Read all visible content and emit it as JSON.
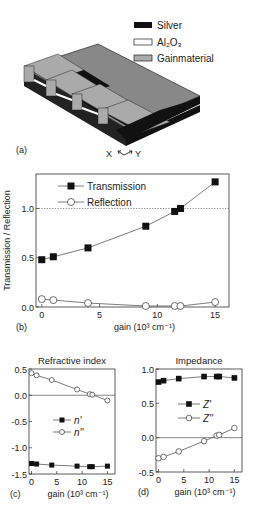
{
  "panel_a": {
    "label": "(a)",
    "legend": [
      {
        "name": "Silver",
        "color": "#111111"
      },
      {
        "name": "Al2O3",
        "display": "Al₂O₃",
        "color": "#ffffff"
      },
      {
        "name": "Gainmaterial",
        "color": "#aaaaaa"
      }
    ],
    "axes_hint": {
      "x": "X",
      "y": "Y"
    }
  },
  "chart_data": [
    {
      "panel": "(b)",
      "type": "line",
      "title": "",
      "xlabel": "gain (10³ cm⁻¹)",
      "ylabel": "Transmission / Reflection",
      "xlim": [
        -0.5,
        16.2
      ],
      "ylim": [
        0.0,
        1.35
      ],
      "xticks": [
        "0",
        "5",
        "10",
        "15"
      ],
      "yticks": [
        "0.0",
        "0.5",
        "1.0"
      ],
      "reference_line": {
        "y": 1.0,
        "style": "dotted"
      },
      "legend_position": "upper-left",
      "x": [
        0,
        1,
        4,
        9,
        11.5,
        12,
        15
      ],
      "series": [
        {
          "name": "Transmission",
          "marker": "filled-square",
          "values": [
            0.48,
            0.51,
            0.6,
            0.82,
            0.97,
            1.0,
            1.27
          ]
        },
        {
          "name": "Reflection",
          "marker": "open-circle",
          "values": [
            0.08,
            0.07,
            0.04,
            0.01,
            0.01,
            0.01,
            0.05
          ]
        }
      ]
    },
    {
      "panel": "(c)",
      "type": "line",
      "title": "Refractive index",
      "xlabel": "gain (10³ cm⁻¹)",
      "ylabel": "",
      "xlim": [
        -0.5,
        16.5
      ],
      "ylim": [
        -1.5,
        0.5
      ],
      "xticks": [
        "0",
        "5",
        "10",
        "15"
      ],
      "yticks": [
        "0.5",
        "0.0",
        "-0.5",
        "-1.0",
        "-1.5"
      ],
      "reference_line": {
        "y": 0.0,
        "style": "solid"
      },
      "legend_position": "center",
      "x": [
        0,
        1,
        4,
        9,
        11.5,
        12,
        15
      ],
      "series": [
        {
          "name": "n'",
          "marker": "filled-square",
          "values": [
            -1.3,
            -1.31,
            -1.33,
            -1.35,
            -1.36,
            -1.36,
            -1.35
          ]
        },
        {
          "name": "n''",
          "marker": "open-circle",
          "values": [
            0.42,
            0.38,
            0.29,
            0.11,
            0.02,
            0.01,
            -0.1
          ]
        }
      ]
    },
    {
      "panel": "(d)",
      "type": "line",
      "title": "Impedance",
      "xlabel": "gain (10³ cm⁻¹)",
      "ylabel": "",
      "xlim": [
        -0.5,
        16.5
      ],
      "ylim": [
        -0.5,
        1.0
      ],
      "xticks": [
        "0",
        "5",
        "10",
        "15"
      ],
      "yticks": [
        "1.0",
        "0.5",
        "0.0",
        "-0.5"
      ],
      "reference_line": {
        "y": 0.0,
        "style": "solid"
      },
      "legend_position": "center",
      "x": [
        0,
        1,
        4,
        9,
        11.5,
        12,
        15
      ],
      "series": [
        {
          "name": "Z'",
          "marker": "filled-square",
          "values": [
            0.81,
            0.83,
            0.86,
            0.89,
            0.89,
            0.89,
            0.87
          ]
        },
        {
          "name": "Z''",
          "marker": "open-circle",
          "values": [
            -0.3,
            -0.28,
            -0.2,
            -0.05,
            0.03,
            0.04,
            0.14
          ]
        }
      ]
    }
  ],
  "labels": {
    "b": "(b)",
    "c": "(c)",
    "d": "(d)"
  }
}
